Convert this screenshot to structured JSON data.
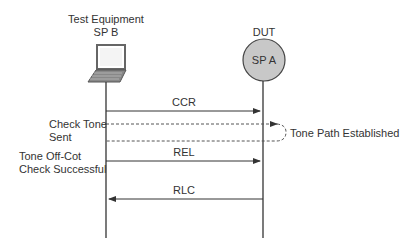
{
  "participants": {
    "left": {
      "title_line1": "Test Equipment",
      "title_line2": "SP B",
      "icon": "laptop-icon"
    },
    "right": {
      "title": "DUT",
      "node_label": "SP A",
      "icon": "circle-node",
      "fill": "#c8c8c8"
    }
  },
  "messages": [
    {
      "label": "CCR",
      "direction": "right",
      "style": "solid"
    },
    {
      "label": "REL",
      "direction": "right",
      "style": "solid"
    },
    {
      "label": "RLC",
      "direction": "left",
      "style": "solid"
    }
  ],
  "tone": {
    "left_note_line1": "Check Tone",
    "left_note_line2": "Sent",
    "loop_label": "Tone Path Established",
    "style": "dashed"
  },
  "result_note": {
    "line1": "Tone Off-Cot",
    "line2": "Check Successful"
  },
  "colors": {
    "line": "#333333",
    "node_fill": "#c8c8c8",
    "laptop": "#555555"
  }
}
